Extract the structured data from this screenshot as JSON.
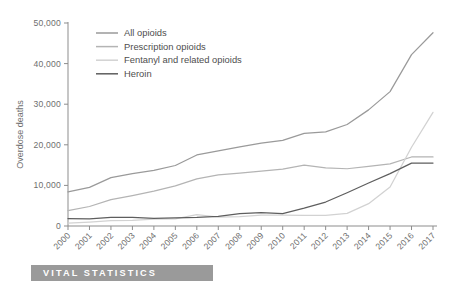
{
  "banner": {
    "label": "VITAL STATISTICS"
  },
  "chart_data": {
    "type": "line",
    "title": "",
    "xlabel": "",
    "ylabel": "Overdose deaths",
    "categories": [
      "2000",
      "2001",
      "2002",
      "2003",
      "2004",
      "2005",
      "2006",
      "2007",
      "2008",
      "2009",
      "2010",
      "2011",
      "2012",
      "2013",
      "2014",
      "2015",
      "2016",
      "2017"
    ],
    "ylim": [
      0,
      50000
    ],
    "ytick_values": [
      0,
      10000,
      20000,
      30000,
      40000,
      50000
    ],
    "ytick_labels": [
      "0",
      "10,000",
      "20,000",
      "30,000",
      "40,000",
      "50,000"
    ],
    "grid": false,
    "legend_position": "top-left",
    "series": [
      {
        "name": "All opioids",
        "color": "#9a9a9a",
        "values": [
          8400,
          9500,
          11900,
          12900,
          13700,
          14900,
          17500,
          18500,
          19500,
          20400,
          21100,
          22800,
          23200,
          25000,
          28600,
          33100,
          42200,
          47600
        ]
      },
      {
        "name": "Prescription opioids",
        "color": "#b4b4b4",
        "values": [
          3800,
          4800,
          6500,
          7500,
          8600,
          9900,
          11600,
          12600,
          13000,
          13500,
          14000,
          15000,
          14300,
          14100,
          14700,
          15300,
          17000,
          17000
        ]
      },
      {
        "name": "Fentanyl and related opioids",
        "color": "#d2d2d2",
        "values": [
          730,
          960,
          1300,
          1400,
          1700,
          1750,
          2800,
          2200,
          2300,
          2700,
          2700,
          2600,
          2600,
          3100,
          5500,
          9600,
          19400,
          28000
        ]
      },
      {
        "name": "Heroin",
        "color": "#5e5e5e",
        "values": [
          1840,
          1780,
          2100,
          2100,
          1900,
          2000,
          2100,
          2400,
          3040,
          3280,
          3030,
          4400,
          5900,
          8200,
          10600,
          12900,
          15500,
          15500
        ]
      }
    ]
  }
}
